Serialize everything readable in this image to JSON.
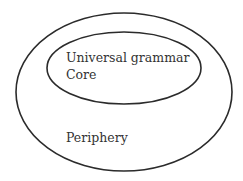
{
  "diagram": {
    "type": "nested-ellipses",
    "colors": {
      "background": "#ffffff",
      "stroke": "#2b2b2b",
      "text": "#333333"
    },
    "outer": {
      "label": "Periphery",
      "cx": 124,
      "cy": 92,
      "rx": 108,
      "ry": 79
    },
    "inner": {
      "labels": [
        "Universal grammar",
        "Core"
      ],
      "cx": 124,
      "cy": 68,
      "rx": 77,
      "ry": 36
    }
  }
}
